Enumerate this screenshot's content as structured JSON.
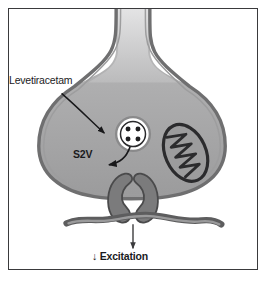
{
  "figure": {
    "title_alt": "Presynaptic axon terminal showing Levetiracetam binding to S2V synaptic vesicle protein",
    "frame": {
      "border_color": "#3a3a3c",
      "background_color": "#ffffff"
    },
    "labels": {
      "drug": "Levetiracetam",
      "vesicle_protein": "S2V",
      "outcome": "↓ Excitation"
    },
    "structures": {
      "axon_terminal": {
        "name": "presynaptic axon terminal",
        "cytoplasm_color": "#a9a9a9",
        "membrane_color": "#6f6f70",
        "membrane_inner_color": "#8d8d8e"
      },
      "synaptic_vesicle": {
        "name": "synaptic vesicle",
        "fill_color": "#ffffff",
        "ring_color": "#8a8a8b",
        "dot_color": "#1f1f21",
        "dot_count": 4
      },
      "mitochondrion": {
        "name": "mitochondrion",
        "fill_color": "#9a9a9b",
        "outline_color": "#2b2b2d",
        "cristae_color": "#2b2b2d"
      },
      "receptors": {
        "name": "neurotransmitter receptors",
        "count": 2,
        "fill_color": "#7b7b7c",
        "outline_color": "#4a4a4b"
      },
      "postsynaptic_membrane": {
        "name": "postsynaptic membrane",
        "fill_color": "#8b8b8c",
        "outline_color": "#5d5d5e"
      }
    },
    "arrows": {
      "drug_arrow": {
        "name": "levetiracetam-to-vesicle arrow",
        "color": "#18181a"
      },
      "vesicle_protein_arrow": {
        "name": "vesicle-to-s2v arrow",
        "color": "#18181a"
      },
      "excitation_arrow": {
        "name": "downward excitation arrow",
        "color": "#3a3a3c"
      }
    }
  }
}
